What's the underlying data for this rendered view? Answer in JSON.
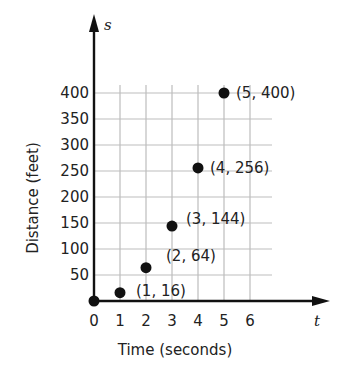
{
  "chart_data": {
    "type": "scatter",
    "title": "",
    "xlabel": "Time (seconds)",
    "ylabel": "Distance (feet)",
    "x_axis_symbol": "t",
    "y_axis_symbol": "s",
    "x_ticks": [
      "0",
      "1",
      "2",
      "3",
      "4",
      "5",
      "6"
    ],
    "y_ticks": [
      "50",
      "100",
      "150",
      "200",
      "250",
      "300",
      "350",
      "400"
    ],
    "xlim": [
      0,
      6
    ],
    "ylim": [
      0,
      400
    ],
    "grid": true,
    "legend": null,
    "points": [
      {
        "x": 0,
        "y": 0,
        "label": ""
      },
      {
        "x": 1,
        "y": 16,
        "label": "(1, 16)"
      },
      {
        "x": 2,
        "y": 64,
        "label": "(2, 64)"
      },
      {
        "x": 3,
        "y": 144,
        "label": "(3, 144)"
      },
      {
        "x": 4,
        "y": 256,
        "label": "(4, 256)"
      },
      {
        "x": 5,
        "y": 400,
        "label": "(5, 400)"
      }
    ]
  }
}
